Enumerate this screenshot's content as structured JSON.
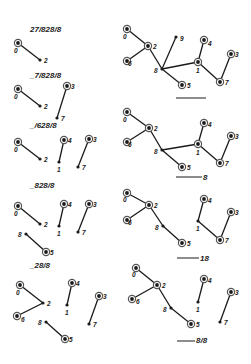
{
  "figure": {
    "colors": {
      "ink": "#1a1a1a",
      "ring": "#555555",
      "background": "#ffffff"
    }
  },
  "panels": [
    {
      "id": "L1",
      "label": "27/828/8",
      "label_pos": [
        30,
        32
      ],
      "underline": null,
      "nodes": [
        {
          "id": "0",
          "x": 18,
          "y": 43,
          "ring": true,
          "lx": 14,
          "ly": 53
        },
        {
          "id": "2",
          "x": 40,
          "y": 60,
          "ring": false,
          "lx": 44,
          "ly": 63
        }
      ],
      "edges": [
        [
          "0",
          "2"
        ]
      ]
    },
    {
      "id": "L2",
      "label": "_7/828/8",
      "label_pos": [
        30,
        78
      ],
      "underline": null,
      "nodes": [
        {
          "id": "0",
          "x": 18,
          "y": 89,
          "ring": true,
          "lx": 14,
          "ly": 99
        },
        {
          "id": "2",
          "x": 40,
          "y": 106,
          "ring": false,
          "lx": 44,
          "ly": 109
        },
        {
          "id": "3",
          "x": 67,
          "y": 86,
          "ring": true,
          "lx": 71,
          "ly": 89
        },
        {
          "id": "7",
          "x": 57,
          "y": 118,
          "ring": false,
          "lx": 61,
          "ly": 121
        }
      ],
      "edges": [
        [
          "0",
          "2"
        ],
        [
          "3",
          "7"
        ]
      ]
    },
    {
      "id": "L3",
      "label": "_/628/8",
      "label_pos": [
        30,
        128
      ],
      "underline": null,
      "nodes": [
        {
          "id": "0",
          "x": 18,
          "y": 142,
          "ring": true,
          "lx": 14,
          "ly": 152
        },
        {
          "id": "2",
          "x": 40,
          "y": 159,
          "ring": false,
          "lx": 44,
          "ly": 162
        },
        {
          "id": "4",
          "x": 64,
          "y": 140,
          "ring": true,
          "lx": 68,
          "ly": 143
        },
        {
          "id": "1",
          "x": 59,
          "y": 162,
          "ring": false,
          "lx": 57,
          "ly": 172
        },
        {
          "id": "3",
          "x": 89,
          "y": 139,
          "ring": true,
          "lx": 93,
          "ly": 142
        },
        {
          "id": "7",
          "x": 78,
          "y": 167,
          "ring": false,
          "lx": 82,
          "ly": 170
        }
      ],
      "edges": [
        [
          "0",
          "2"
        ],
        [
          "4",
          "1"
        ],
        [
          "3",
          "7"
        ]
      ]
    },
    {
      "id": "L4",
      "label": "_828/8",
      "label_pos": [
        30,
        188
      ],
      "underline": null,
      "nodes": [
        {
          "id": "0",
          "x": 18,
          "y": 206,
          "ring": true,
          "lx": 14,
          "ly": 216
        },
        {
          "id": "2",
          "x": 40,
          "y": 224,
          "ring": false,
          "lx": 44,
          "ly": 227
        },
        {
          "id": "4",
          "x": 64,
          "y": 204,
          "ring": true,
          "lx": 68,
          "ly": 207
        },
        {
          "id": "1",
          "x": 59,
          "y": 226,
          "ring": false,
          "lx": 57,
          "ly": 236
        },
        {
          "id": "3",
          "x": 89,
          "y": 204,
          "ring": true,
          "lx": 93,
          "ly": 207
        },
        {
          "id": "7",
          "x": 78,
          "y": 232,
          "ring": false,
          "lx": 82,
          "ly": 235
        },
        {
          "id": "8",
          "x": 26,
          "y": 234,
          "ring": false,
          "lx": 18,
          "ly": 237
        },
        {
          "id": "5",
          "x": 46,
          "y": 252,
          "ring": true,
          "lx": 50,
          "ly": 255
        }
      ],
      "edges": [
        [
          "0",
          "2"
        ],
        [
          "4",
          "1"
        ],
        [
          "3",
          "7"
        ],
        [
          "8",
          "5"
        ]
      ]
    },
    {
      "id": "L5",
      "label": "_28/8",
      "label_pos": [
        30,
        268
      ],
      "underline": null,
      "nodes": [
        {
          "id": "0",
          "x": 20,
          "y": 285,
          "ring": true,
          "lx": 16,
          "ly": 295
        },
        {
          "id": "2",
          "x": 43,
          "y": 303,
          "ring": false,
          "lx": 47,
          "ly": 306
        },
        {
          "id": "6",
          "x": 17,
          "y": 316,
          "ring": true,
          "lx": 21,
          "ly": 322
        },
        {
          "id": "4",
          "x": 72,
          "y": 283,
          "ring": true,
          "lx": 76,
          "ly": 286
        },
        {
          "id": "1",
          "x": 67,
          "y": 305,
          "ring": false,
          "lx": 65,
          "ly": 315
        },
        {
          "id": "3",
          "x": 99,
          "y": 296,
          "ring": true,
          "lx": 103,
          "ly": 299
        },
        {
          "id": "7",
          "x": 89,
          "y": 324,
          "ring": false,
          "lx": 93,
          "ly": 327
        },
        {
          "id": "8",
          "x": 46,
          "y": 322,
          "ring": false,
          "lx": 38,
          "ly": 325
        },
        {
          "id": "5",
          "x": 65,
          "y": 339,
          "ring": true,
          "lx": 69,
          "ly": 342
        }
      ],
      "edges": [
        [
          "0",
          "2"
        ],
        [
          "6",
          "2"
        ],
        [
          "4",
          "1"
        ],
        [
          "3",
          "7"
        ],
        [
          "8",
          "5"
        ]
      ]
    },
    {
      "id": "R1",
      "label": "",
      "label_pos": [
        206,
        100
      ],
      "underline": [
        176,
        206,
        98
      ],
      "nodes": [
        {
          "id": "0",
          "x": 127,
          "y": 29,
          "ring": true,
          "lx": 123,
          "ly": 39
        },
        {
          "id": "2",
          "x": 148,
          "y": 46,
          "ring": true,
          "lx": 153,
          "ly": 49
        },
        {
          "id": "6",
          "x": 127,
          "y": 61,
          "ring": true,
          "lx": 128,
          "ly": 66
        },
        {
          "id": "8",
          "x": 162,
          "y": 69,
          "ring": false,
          "lx": 154,
          "ly": 73
        },
        {
          "id": "9",
          "x": 176,
          "y": 37,
          "ring": false,
          "lx": 180,
          "ly": 41
        },
        {
          "id": "4",
          "x": 204,
          "y": 40,
          "ring": true,
          "lx": 208,
          "ly": 46
        },
        {
          "id": "1",
          "x": 198,
          "y": 62,
          "ring": true,
          "lx": 196,
          "ly": 73
        },
        {
          "id": "3",
          "x": 231,
          "y": 54,
          "ring": true,
          "lx": 235,
          "ly": 57
        },
        {
          "id": "7",
          "x": 220,
          "y": 82,
          "ring": true,
          "lx": 225,
          "ly": 85
        },
        {
          "id": "5",
          "x": 182,
          "y": 85,
          "ring": true,
          "lx": 187,
          "ly": 88
        }
      ],
      "edges": [
        [
          "0",
          "2"
        ],
        [
          "6",
          "2"
        ],
        [
          "2",
          "8"
        ],
        [
          "8",
          "9"
        ],
        [
          "8",
          "1"
        ],
        [
          "8",
          "5"
        ],
        [
          "4",
          "1"
        ],
        [
          "1",
          "7"
        ],
        [
          "7",
          "3"
        ]
      ]
    },
    {
      "id": "R2",
      "label": "8",
      "label_pos": [
        203,
        180
      ],
      "underline": [
        176,
        202,
        177
      ],
      "nodes": [
        {
          "id": "0",
          "x": 127,
          "y": 112,
          "ring": true,
          "lx": 123,
          "ly": 122
        },
        {
          "id": "2",
          "x": 149,
          "y": 128,
          "ring": true,
          "lx": 154,
          "ly": 131
        },
        {
          "id": "6",
          "x": 127,
          "y": 142,
          "ring": true,
          "lx": 128,
          "ly": 147
        },
        {
          "id": "8",
          "x": 162,
          "y": 150,
          "ring": false,
          "lx": 154,
          "ly": 154
        },
        {
          "id": "4",
          "x": 204,
          "y": 123,
          "ring": true,
          "lx": 208,
          "ly": 127
        },
        {
          "id": "1",
          "x": 198,
          "y": 144,
          "ring": true,
          "lx": 196,
          "ly": 155
        },
        {
          "id": "3",
          "x": 231,
          "y": 136,
          "ring": true,
          "lx": 235,
          "ly": 139
        },
        {
          "id": "7",
          "x": 220,
          "y": 163,
          "ring": true,
          "lx": 225,
          "ly": 166
        },
        {
          "id": "5",
          "x": 182,
          "y": 167,
          "ring": true,
          "lx": 187,
          "ly": 170
        }
      ],
      "edges": [
        [
          "0",
          "2"
        ],
        [
          "6",
          "2"
        ],
        [
          "2",
          "8"
        ],
        [
          "8",
          "1"
        ],
        [
          "8",
          "5"
        ],
        [
          "4",
          "1"
        ],
        [
          "1",
          "7"
        ],
        [
          "7",
          "3"
        ]
      ]
    },
    {
      "id": "R3",
      "label": "18",
      "label_pos": [
        200,
        261
      ],
      "underline": [
        177,
        199,
        258
      ],
      "nodes": [
        {
          "id": "0",
          "x": 127,
          "y": 193,
          "ring": true,
          "lx": 123,
          "ly": 202
        },
        {
          "id": "2",
          "x": 149,
          "y": 205,
          "ring": true,
          "lx": 154,
          "ly": 208
        },
        {
          "id": "6",
          "x": 127,
          "y": 220,
          "ring": true,
          "lx": 128,
          "ly": 225
        },
        {
          "id": "8",
          "x": 163,
          "y": 226,
          "ring": false,
          "lx": 155,
          "ly": 230
        },
        {
          "id": "4",
          "x": 204,
          "y": 199,
          "ring": true,
          "lx": 208,
          "ly": 203
        },
        {
          "id": "1",
          "x": 198,
          "y": 221,
          "ring": false,
          "lx": 196,
          "ly": 231
        },
        {
          "id": "3",
          "x": 231,
          "y": 212,
          "ring": true,
          "lx": 235,
          "ly": 215
        },
        {
          "id": "7",
          "x": 220,
          "y": 240,
          "ring": true,
          "lx": 225,
          "ly": 243
        },
        {
          "id": "5",
          "x": 182,
          "y": 243,
          "ring": true,
          "lx": 187,
          "ly": 246
        }
      ],
      "edges": [
        [
          "0",
          "2"
        ],
        [
          "6",
          "2"
        ],
        [
          "2",
          "8"
        ],
        [
          "8",
          "5"
        ],
        [
          "4",
          "1"
        ],
        [
          "1",
          "7"
        ],
        [
          "7",
          "3"
        ]
      ]
    },
    {
      "id": "R4",
      "label": "8/8",
      "label_pos": [
        196,
        343
      ],
      "underline": [
        177,
        195,
        341
      ],
      "nodes": [
        {
          "id": "0",
          "x": 136,
          "y": 268,
          "ring": true,
          "lx": 132,
          "ly": 277
        },
        {
          "id": "2",
          "x": 157,
          "y": 285,
          "ring": true,
          "lx": 162,
          "ly": 288
        },
        {
          "id": "6",
          "x": 132,
          "y": 299,
          "ring": true,
          "lx": 136,
          "ly": 304
        },
        {
          "id": "8",
          "x": 171,
          "y": 308,
          "ring": false,
          "lx": 163,
          "ly": 312
        },
        {
          "id": "5",
          "x": 191,
          "y": 324,
          "ring": true,
          "lx": 196,
          "ly": 327
        },
        {
          "id": "4",
          "x": 204,
          "y": 279,
          "ring": true,
          "lx": 208,
          "ly": 283
        },
        {
          "id": "1",
          "x": 198,
          "y": 302,
          "ring": false,
          "lx": 196,
          "ly": 312
        },
        {
          "id": "3",
          "x": 231,
          "y": 292,
          "ring": true,
          "lx": 235,
          "ly": 295
        },
        {
          "id": "7",
          "x": 220,
          "y": 322,
          "ring": false,
          "lx": 224,
          "ly": 325
        }
      ],
      "edges": [
        [
          "0",
          "2"
        ],
        [
          "6",
          "2"
        ],
        [
          "2",
          "8"
        ],
        [
          "8",
          "5"
        ],
        [
          "4",
          "1"
        ],
        [
          "3",
          "7"
        ]
      ]
    }
  ]
}
